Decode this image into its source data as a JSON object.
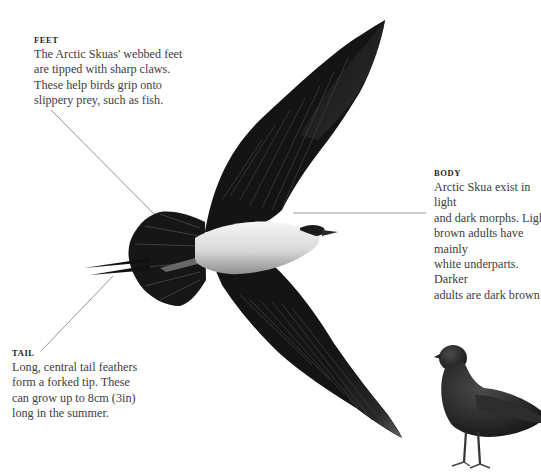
{
  "subject": "Arctic Skua",
  "annotations": {
    "feet": {
      "heading": "FEET",
      "text": "The Arctic Skuas' webbed feet\nare tipped with sharp claws.\nThese help birds grip onto\nslippery prey, such as fish."
    },
    "body": {
      "heading": "BODY",
      "text": "Arctic Skua exist in light\nand dark morphs. Light\nbrown adults have mainly\nwhite underparts. Darker\nadults are dark brown"
    },
    "tail": {
      "heading": "TAIL",
      "text": "Long, central tail feathers\nform a forked tip. These\ncan grow up to 8cm (3in)\nlong in the summer."
    }
  },
  "illustrations": {
    "flying_bird": "arctic-skua-in-flight-underside-view",
    "standing_bird": "arctic-skua-dark-morph-standing"
  },
  "colors": {
    "background": "#ffffff",
    "heading": "#1e1e1e",
    "text": "#3d3d3d",
    "leader_line": "#8a8a8a",
    "plumage_dark": "#151515",
    "underparts": "#e4e4e4"
  }
}
